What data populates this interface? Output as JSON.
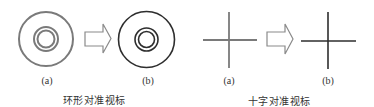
{
  "panels": [
    {
      "name": "ring",
      "caption": "环形对准视标",
      "caption_pos": [
        94,
        99
      ],
      "states": [
        {
          "label": "(a)",
          "label_pos": [
            47,
            80
          ],
          "center": [
            46,
            39
          ],
          "outer_r": 27,
          "inner_r": [
            12,
            8.5
          ],
          "color": "#7a7a7a",
          "stroke": 2
        },
        {
          "label": "(b)",
          "label_pos": [
            148,
            80
          ],
          "center": [
            146.5,
            39.5
          ],
          "outer_r": 28,
          "inner_r": [
            11.5,
            8
          ],
          "color": "#2e2e2e",
          "stroke": 1.6
        }
      ],
      "arrow": {
        "x0": 85,
        "shaft_x1": 103,
        "tip_x": 111,
        "shaft_y0": 32,
        "shaft_y1": 46,
        "head_y0": 24,
        "head_y1": 53,
        "color": "#8a8a8a"
      }
    },
    {
      "name": "cross",
      "caption": "十字对准视标",
      "caption_pos": [
        279,
        100
      ],
      "states": [
        {
          "label": "(a)",
          "label_pos": [
            229,
            80
          ],
          "cx": 229,
          "cy": 40,
          "h": [
            203,
            257
          ],
          "v": [
            12,
            68
          ],
          "color": "#7a7a7a",
          "stroke": 1.8
        },
        {
          "label": "(b)",
          "label_pos": [
            328,
            80
          ],
          "cx": 328,
          "cy": 41,
          "h": [
            301,
            356
          ],
          "v": [
            12,
            69
          ],
          "color": "#2e2e2e",
          "stroke": 1.6
        }
      ],
      "arrow": {
        "x0": 267,
        "shaft_x1": 285,
        "tip_x": 293,
        "shaft_y0": 32,
        "shaft_y1": 46,
        "head_y0": 24,
        "head_y1": 54,
        "color": "#8a8a8a"
      }
    }
  ],
  "labels": {
    "ring_a": "(a)",
    "ring_b": "(b)",
    "ring_caption": "环形对准视标",
    "cross_a": "(a)",
    "cross_b": "(b)",
    "cross_caption": "十字对准视标"
  }
}
